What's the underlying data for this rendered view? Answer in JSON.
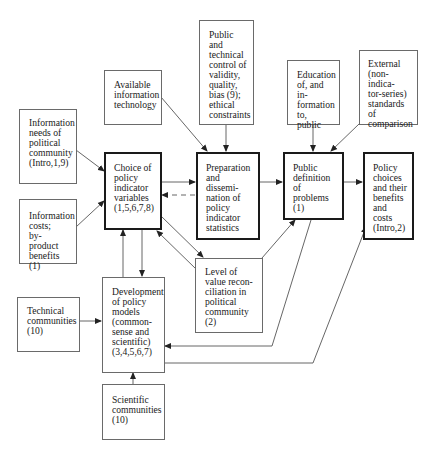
{
  "diagram": {
    "boxes": {
      "info_needs": {
        "text": "Information\nneeds of\npolitical\ncommunity\n(Intro,1,9)"
      },
      "info_costs": {
        "text": "Information\ncosts;\nby-product\nbenefits (1)"
      },
      "available_tech": {
        "text": "Available\ninformation\ntechnology"
      },
      "public_control": {
        "text": "Public and\ntechnical\ncontrol of\nvalidity,\nquality,\nbias (9);\nethical\nconstraints"
      },
      "education": {
        "text": "Education\nof, and in-\nformation\nto, public"
      },
      "external": {
        "text": "External\n(non-indica-\ntor-series)\nstandards of\ncomparison"
      },
      "choice": {
        "text": "Choice of\npolicy\nindicator\nvariables\n(1,5,6,7,8)"
      },
      "preparation": {
        "text": "Preparation\nand dissemi-\nnation of\npolicy\nindicator\nstatistics"
      },
      "public_definition": {
        "text": "Public\ndefinition\nof problems\n          (1)"
      },
      "policy_choices": {
        "text": "Policy\nchoices\nand their\nbenefits\nand costs\n(Intro,2)"
      },
      "level": {
        "text": "Level of\nvalue recon-\nciliation in\npolitical\ncommunity (2)"
      },
      "development": {
        "text": "Development\nof policy\nmodels\n(common-\nsense and\nscientific)\n(3,4,5,6,7)"
      },
      "technical": {
        "text": "Technical\ncommunities\n            (10)"
      },
      "scientific": {
        "text": "Scientific\ncommunities\n            (10)"
      }
    },
    "colors": {
      "line": "#555555",
      "thick_border": "#1a1a1a",
      "thin_border": "#6a6a6a"
    }
  }
}
